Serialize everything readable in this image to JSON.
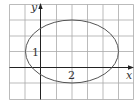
{
  "figure": {
    "type": "ellipse-on-grid",
    "axes": {
      "x_label": "x",
      "y_label": "y"
    },
    "annotations": {
      "left_label": "1",
      "bottom_label": "2"
    },
    "ellipse": {
      "center": [
        2,
        1
      ],
      "semi_axis_x": 3,
      "semi_axis_y": 2
    },
    "grid": {
      "columns": 8,
      "rows": 6
    },
    "colors": {
      "grid": "#a9a9a9",
      "axes": "#222222",
      "curve": "#555555"
    }
  }
}
